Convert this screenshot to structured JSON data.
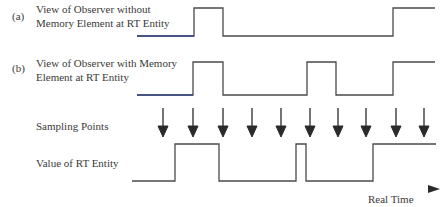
{
  "diagram": {
    "rows": [
      {
        "tag": "(a)",
        "label_line1": "View of  Observer without",
        "label_line2": "Memory  Element at RT Entity"
      },
      {
        "tag": "(b)",
        "label_line1": "View of Observer with Memory",
        "label_line2": "Element at RT Entity"
      },
      {
        "tag": "",
        "label_line1": "Sampling Points",
        "label_line2": ""
      },
      {
        "tag": "",
        "label_line1": "Value of RT Entity",
        "label_line2": ""
      }
    ],
    "axis_label": "Real Time",
    "colors": {
      "line": "#4a4a4a",
      "axis": "#4a5a8a",
      "arrow": "#2a2a2a"
    },
    "sampling_points_x": [
      163,
      193,
      223,
      252,
      281,
      310,
      338,
      366,
      396,
      424
    ]
  }
}
